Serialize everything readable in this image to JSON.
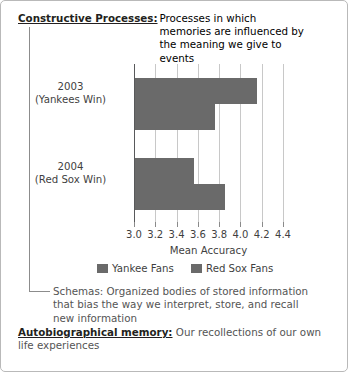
{
  "figure": {
    "border_color": "#b9b9b9",
    "background": "#ffffff"
  },
  "entries": {
    "constructive": {
      "term": "Constructive Processes:",
      "definition_lines": [
        "Processes in which memories are",
        "influenced by the meaning we",
        "give to events"
      ]
    },
    "schemas": {
      "term": "Schemas:",
      "definition_lines": [
        "Schemas: Organized bodies of stored information",
        "that bias the way we interpret, store, and recall",
        "new information"
      ]
    },
    "autobiographical": {
      "term": "Autobiographical memory:",
      "definition_lines": [
        "Our recollections of our own",
        "life experiences"
      ],
      "line1": "Our recollections of our own",
      "line2": "life experiences"
    }
  },
  "chart_data": {
    "type": "bar",
    "orientation": "horizontal",
    "title": "",
    "xlabel": "Mean Accuracy",
    "ylabel": "",
    "xlim": [
      3.0,
      4.4
    ],
    "xticks": [
      "3.0",
      "3.2",
      "3.4",
      "3.6",
      "3.8",
      "4.0",
      "4.2",
      "4.4"
    ],
    "xtick_values": [
      3.0,
      3.2,
      3.4,
      3.6,
      3.8,
      4.0,
      4.2,
      4.4
    ],
    "grid": true,
    "legend_position": "bottom",
    "categories": [
      "2003 (Yankees Win)",
      "2004 (Red Sox Win)"
    ],
    "category_labels": [
      {
        "year": "2003",
        "detail": "(Yankees Win)"
      },
      {
        "year": "2004",
        "detail": "(Red Sox Win)"
      }
    ],
    "series": [
      {
        "name": "Yankee Fans",
        "color": "#6a6a6a",
        "values": [
          4.15,
          3.55
        ]
      },
      {
        "name": "Red Sox Fans",
        "color": "#6a6a6a",
        "values": [
          3.75,
          3.85
        ]
      }
    ]
  }
}
